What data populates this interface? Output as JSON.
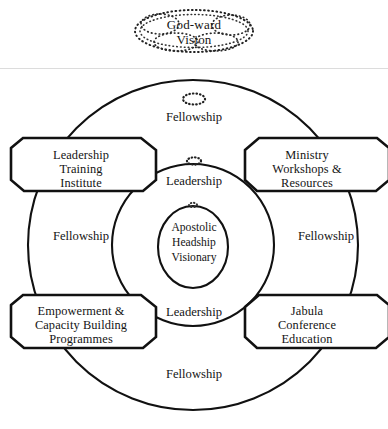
{
  "diagram": {
    "vision": {
      "label": "God-ward\nVision",
      "shape": "dotted-cloud-ellipse"
    },
    "core": {
      "label": "Apostolic\nHeadship\nVisionary",
      "shape": "circle"
    },
    "boxes": [
      {
        "id": "top-left",
        "label": "Leadership\nTraining\nInstitute"
      },
      {
        "id": "top-right",
        "label": "Ministry\nWorkshops &\nResources"
      },
      {
        "id": "bottom-left",
        "label": "Empowerment &\nCapacity Building\nProgrammes"
      },
      {
        "id": "bottom-right",
        "label": "Jabula\nConference\nEducation"
      }
    ],
    "rings": {
      "outer_label_top": "Fellowship",
      "outer_label_bottom": "Fellowship",
      "outer_label_left": "Fellowship",
      "outer_label_right": "Fellowship",
      "inner_label_top": "Leadership",
      "inner_label_bottom": "Leadership"
    },
    "colors": {
      "background": "#ffffff",
      "stroke": "#111111",
      "text": "#141414",
      "divider": "#d8d8d8"
    }
  }
}
